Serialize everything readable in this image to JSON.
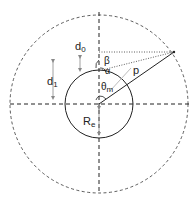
{
  "diagram": {
    "labels": {
      "d0": "d",
      "d0_sub": "0",
      "d1": "d",
      "d1_sub": "1",
      "beta": "β",
      "alpha": "α",
      "p": "p",
      "theta": "θ",
      "theta_sub": "m",
      "re": "R",
      "re_sub": "e"
    },
    "colors": {
      "line": "#222222",
      "dashed": "#333333",
      "arrow_gray": "#888888",
      "guide_gray": "#aaaaaa"
    },
    "geometry": {
      "center": [
        99,
        104
      ],
      "outer_radius": 89,
      "inner_radius": 34,
      "point_p": [
        174,
        52
      ]
    }
  }
}
